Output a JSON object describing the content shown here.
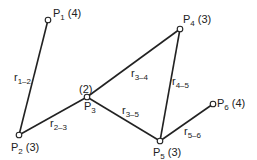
{
  "nodes": [
    {
      "id": "P1",
      "label": "P",
      "sub": "1",
      "weight": "(4)",
      "x": 48,
      "y": 20
    },
    {
      "id": "P2",
      "label": "P",
      "sub": "2",
      "weight": "(3)",
      "x": 19,
      "y": 135
    },
    {
      "id": "P3",
      "label": "P",
      "sub": "3",
      "weight": "(2)",
      "x": 87,
      "y": 97
    },
    {
      "id": "P4",
      "label": "P",
      "sub": "4",
      "weight": "(3)",
      "x": 180,
      "y": 29
    },
    {
      "id": "P5",
      "label": "P",
      "sub": "5",
      "weight": "(3)",
      "x": 160,
      "y": 141
    },
    {
      "id": "P6",
      "label": "P",
      "sub": "6",
      "weight": "(4)",
      "x": 213,
      "y": 104
    }
  ],
  "edges": [
    {
      "from": "P1",
      "to": "P2",
      "label": "r",
      "sub": "1–2"
    },
    {
      "from": "P2",
      "to": "P3",
      "label": "r",
      "sub": "2–3"
    },
    {
      "from": "P3",
      "to": "P4",
      "label": "r",
      "sub": "3–4"
    },
    {
      "from": "P3",
      "to": "P5",
      "label": "r",
      "sub": "3–5"
    },
    {
      "from": "P4",
      "to": "P5",
      "label": "r",
      "sub": "4–5"
    },
    {
      "from": "P5",
      "to": "P6",
      "label": "r",
      "sub": "5–6"
    }
  ],
  "colors": {
    "line": "#222222",
    "background": "#ffffff"
  }
}
